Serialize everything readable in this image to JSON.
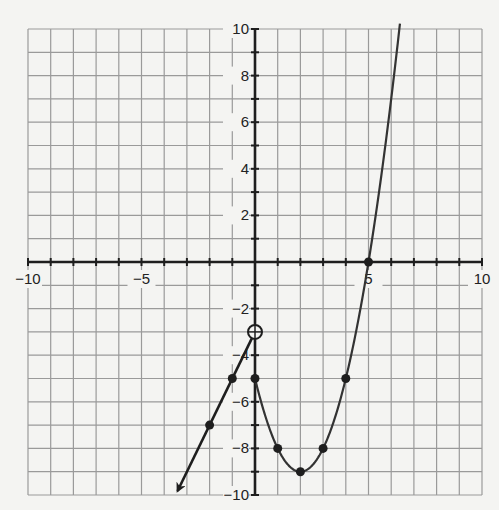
{
  "chart_data": {
    "type": "line",
    "title": "",
    "xlabel": "",
    "ylabel": "",
    "xlim": [
      -10,
      10
    ],
    "ylim": [
      -10,
      10
    ],
    "grid": true,
    "grid_step": 1,
    "x_tick_labels": [
      {
        "value": -10,
        "label": "−10"
      },
      {
        "value": -5,
        "label": "−5"
      },
      {
        "value": 5,
        "label": "5"
      },
      {
        "value": 10,
        "label": "10"
      }
    ],
    "y_tick_labels": [
      {
        "value": 10,
        "label": "10"
      },
      {
        "value": 8,
        "label": "8"
      },
      {
        "value": 6,
        "label": "6"
      },
      {
        "value": 4,
        "label": "4"
      },
      {
        "value": 2,
        "label": "2"
      },
      {
        "value": -2,
        "label": "−2"
      },
      {
        "value": -4,
        "label": "−4"
      },
      {
        "value": -6,
        "label": "−6"
      },
      {
        "value": -8,
        "label": "−8"
      },
      {
        "value": -10,
        "label": "−10"
      }
    ],
    "series": [
      {
        "name": "linear piece (x < 0)",
        "equation": "y = 2x - 3",
        "style": "line with arrow toward lower-left",
        "points": [
          [
            0,
            -3
          ],
          [
            -1,
            -5
          ],
          [
            -2,
            -7
          ]
        ],
        "open_endpoint": [
          0,
          -3
        ],
        "arrow_end": [
          -3.5,
          -10
        ]
      },
      {
        "name": "quadratic piece (x >= 0)",
        "equation": "y = x^2 - 4x - 5",
        "style": "curve",
        "points": [
          [
            0,
            -5
          ],
          [
            1,
            -8
          ],
          [
            2,
            -9
          ],
          [
            3,
            -8
          ],
          [
            4,
            -5
          ],
          [
            5,
            0
          ]
        ],
        "closed_endpoint": [
          0,
          -5
        ],
        "curve_end": [
          6.385,
          10
        ]
      }
    ]
  }
}
